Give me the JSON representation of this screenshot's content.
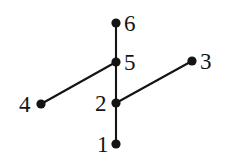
{
  "figure": {
    "kind": "graph-diagram",
    "background_color": "#ffffff",
    "ink_color": "#141414",
    "width": 230,
    "height": 162
  },
  "chart_data": {
    "type": "scatter",
    "title": "",
    "xlabel": "",
    "ylabel": "",
    "grid": false,
    "legend": null,
    "nodes": [
      {
        "id": "1",
        "label": "1",
        "x": 116,
        "y": 144,
        "label_side": "left",
        "label_x": 97,
        "label_y": 133
      },
      {
        "id": "2",
        "label": "2",
        "x": 116,
        "y": 103,
        "label_side": "left",
        "label_x": 95,
        "label_y": 92
      },
      {
        "id": "3",
        "label": "3",
        "x": 192,
        "y": 61,
        "label_side": "right",
        "label_x": 200,
        "label_y": 50
      },
      {
        "id": "4",
        "label": "4",
        "x": 41,
        "y": 104,
        "label_side": "left",
        "label_x": 19,
        "label_y": 93
      },
      {
        "id": "5",
        "label": "5",
        "x": 116,
        "y": 62,
        "label_side": "right",
        "label_x": 124,
        "label_y": 51
      },
      {
        "id": "6",
        "label": "6",
        "x": 116,
        "y": 23,
        "label_side": "right",
        "label_x": 124,
        "label_y": 12
      }
    ],
    "edges": [
      {
        "from": "6",
        "to": "5"
      },
      {
        "from": "5",
        "to": "2"
      },
      {
        "from": "2",
        "to": "1"
      },
      {
        "from": "4",
        "to": "5"
      },
      {
        "from": "2",
        "to": "3"
      }
    ],
    "node_radius": 4.6,
    "edge_width": 2.1
  }
}
